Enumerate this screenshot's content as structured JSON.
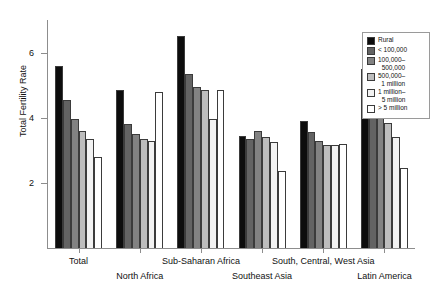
{
  "chart_data": {
    "type": "bar",
    "title": "",
    "xlabel": "",
    "ylabel": "Total Fertility Rate",
    "ylim": [
      0,
      7
    ],
    "yticks": [
      2,
      4,
      6
    ],
    "ytick_labels": [
      "2",
      "4",
      "6"
    ],
    "grid": false,
    "legend_position": "top-right",
    "categories": [
      "Total",
      "North Africa",
      "Sub-Saharan Africa",
      "Southeast Asia",
      "South, Central, West Asia",
      "Latin America"
    ],
    "series": [
      {
        "name": "Rural",
        "color": "#0d0d0d",
        "values": [
          5.6,
          4.85,
          6.5,
          3.45,
          3.9,
          5.5
        ]
      },
      {
        "name": "< 100,000",
        "color": "#636363",
        "values": [
          4.55,
          3.8,
          5.35,
          3.35,
          3.55,
          4.85
        ]
      },
      {
        "name": "100,000–500,000",
        "color": "#828282",
        "values": [
          3.95,
          3.5,
          4.95,
          3.6,
          3.3,
          4.5
        ]
      },
      {
        "name": "500,000–1 million",
        "color": "#bdbdbd",
        "values": [
          3.6,
          3.35,
          4.85,
          3.4,
          3.15,
          3.85
        ]
      },
      {
        "name": "1 million–5 million",
        "color": "#f2f2f2",
        "values": [
          3.35,
          3.3,
          3.95,
          3.25,
          3.15,
          3.4
        ]
      },
      {
        "name": "> 5 million",
        "color": "#ffffff",
        "values": [
          2.8,
          4.8,
          4.85,
          2.35,
          3.2,
          2.45
        ]
      }
    ]
  },
  "legend": {
    "items": [
      {
        "line1": "Rural",
        "line2": ""
      },
      {
        "line1": "< 100,000",
        "line2": ""
      },
      {
        "line1": "100,000–",
        "line2": "500,000"
      },
      {
        "line1": "500,000–",
        "line2": "1 million"
      },
      {
        "line1": "1 million–",
        "line2": "5 million"
      },
      {
        "line1": "> 5 million",
        "line2": ""
      }
    ]
  },
  "axis": {
    "y_title": "Total Fertility Rate",
    "y_labels": [
      "6",
      "4",
      "2"
    ]
  },
  "x_labels": [
    {
      "text": "Total",
      "row": "a"
    },
    {
      "text": "North Africa",
      "row": "b"
    },
    {
      "text": "Sub-Saharan Africa",
      "row": "a"
    },
    {
      "text": "Southeast Asia",
      "row": "b"
    },
    {
      "text": "South, Central, West Asia",
      "row": "a"
    },
    {
      "text": "Latin America",
      "row": "b"
    }
  ]
}
